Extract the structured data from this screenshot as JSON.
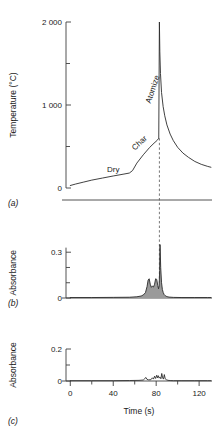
{
  "figure": {
    "xlabel": "Time (s)",
    "x_ticks_major": [
      0,
      40,
      80,
      120
    ],
    "x_ticks_minor": [
      20,
      60,
      100
    ],
    "xlim": [
      -4,
      132
    ],
    "atomize_time": 83
  },
  "panels": [
    {
      "key": "a",
      "label": "(a)",
      "ylabel": "Temperature (°C)",
      "y_ticks_major": [
        0,
        1000,
        2000
      ],
      "y_ticks_major_labels": [
        "0",
        "1 000",
        "2 000"
      ],
      "y_ticks_minor": [
        500,
        1500
      ],
      "ylim": [
        0,
        2000
      ],
      "annotations": [
        {
          "text": "Dry",
          "time": 40,
          "value": 190,
          "rotation": 0
        },
        {
          "text": "Char",
          "time": 66,
          "value": 520,
          "rotation": -42
        },
        {
          "text": "Atomize",
          "time": 79,
          "value": 1180,
          "rotation": -72
        }
      ]
    },
    {
      "key": "b",
      "label": "(b)",
      "ylabel": "Absorbance",
      "y_ticks_major": [
        0,
        0.3
      ],
      "y_ticks_major_labels": [
        "0",
        "0.3"
      ],
      "y_ticks_minor": [
        0.1,
        0.2
      ],
      "ylim": [
        0,
        0.38
      ]
    },
    {
      "key": "c",
      "label": "(c)",
      "ylabel": "Absorbance",
      "y_ticks_major": [
        0,
        0.2
      ],
      "y_ticks_major_labels": [
        "0",
        "0.2"
      ],
      "y_ticks_minor": [
        0.1
      ],
      "ylim": [
        0,
        0.25
      ]
    }
  ],
  "chart_data": [
    {
      "type": "line",
      "panel": "a",
      "title": "",
      "xlabel": "",
      "ylabel": "Temperature (°C)",
      "xlim": [
        -4,
        132
      ],
      "ylim": [
        0,
        2000
      ],
      "grid": false,
      "legend": null,
      "annotations": [
        "Dry",
        "Char",
        "Atomize"
      ],
      "x": [
        0,
        5,
        12,
        20,
        30,
        40,
        50,
        55,
        58,
        62,
        68,
        74,
        78,
        81,
        82.4,
        83,
        83.4,
        84,
        85,
        86.5,
        88,
        90,
        93,
        96,
        100,
        105,
        110,
        116,
        122,
        128,
        131
      ],
      "y": [
        30,
        48,
        70,
        95,
        120,
        145,
        168,
        180,
        210,
        300,
        400,
        490,
        540,
        575,
        600,
        2000,
        1640,
        1380,
        1150,
        980,
        870,
        760,
        650,
        570,
        490,
        420,
        370,
        320,
        285,
        260,
        250
      ]
    },
    {
      "type": "area",
      "panel": "b",
      "title": "",
      "xlabel": "",
      "ylabel": "Absorbance",
      "xlim": [
        -4,
        132
      ],
      "ylim": [
        0,
        0.38
      ],
      "grid": false,
      "legend": null,
      "x": [
        0,
        20,
        40,
        55,
        62,
        66,
        68,
        70,
        71.5,
        72.5,
        73.5,
        74.5,
        75.5,
        76.5,
        77.5,
        78.5,
        79.5,
        80.5,
        81.5,
        82.2,
        82.8,
        83.2,
        83.6,
        84.2,
        85,
        85.8,
        86.6,
        87.5,
        88.5,
        90,
        92,
        96,
        104,
        116,
        128,
        131
      ],
      "y": [
        0.003,
        0.003,
        0.004,
        0.005,
        0.008,
        0.013,
        0.02,
        0.035,
        0.075,
        0.118,
        0.126,
        0.09,
        0.07,
        0.078,
        0.072,
        0.09,
        0.126,
        0.122,
        0.082,
        0.06,
        0.08,
        0.18,
        0.35,
        0.2,
        0.1,
        0.055,
        0.035,
        0.022,
        0.015,
        0.009,
        0.006,
        0.004,
        0.003,
        0.003,
        0.003,
        0.003
      ]
    },
    {
      "type": "line",
      "panel": "c",
      "title": "",
      "xlabel": "Time (s)",
      "ylabel": "Absorbance",
      "xlim": [
        -4,
        132
      ],
      "ylim": [
        0,
        0.25
      ],
      "grid": false,
      "legend": null,
      "x": [
        0,
        20,
        40,
        55,
        64,
        68,
        69.5,
        70.5,
        71.5,
        73,
        75,
        76.5,
        77.5,
        78.5,
        79.5,
        80.5,
        81.3,
        82,
        82.8,
        83.6,
        84.4,
        85.2,
        86,
        86.8,
        87.6,
        88.4,
        89.5,
        91,
        93,
        96,
        104,
        116,
        128,
        131
      ],
      "y": [
        0.002,
        0.002,
        0.002,
        0.003,
        0.004,
        0.006,
        0.016,
        0.022,
        0.01,
        0.007,
        0.008,
        0.02,
        0.012,
        0.03,
        0.016,
        0.036,
        0.02,
        0.033,
        0.018,
        0.024,
        0.014,
        0.047,
        0.02,
        0.012,
        0.04,
        0.014,
        0.008,
        0.004,
        0.003,
        0.002,
        0.002,
        0.002,
        0.002,
        0.002
      ]
    }
  ]
}
